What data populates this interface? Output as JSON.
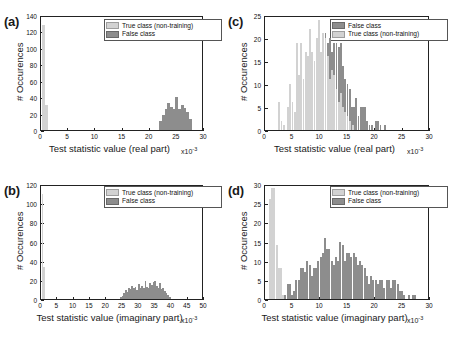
{
  "figure": {
    "series_labels": {
      "true_class": "True class (non-training)",
      "false_class": "False class"
    },
    "colors": {
      "true_class": "#d2d2d2",
      "false_class": "#8d8d8d",
      "axis": "#222222",
      "background": "#ffffff"
    },
    "ylabel": "# Occurences",
    "exponent": "x10",
    "exponent_sup": "-3"
  },
  "panels": [
    {
      "id": "a",
      "tag": "(a)"
    },
    {
      "id": "b",
      "tag": "(b)"
    },
    {
      "id": "c",
      "tag": "(c)"
    },
    {
      "id": "d",
      "tag": "(d)"
    }
  ],
  "chart_data": [
    {
      "panel": "a",
      "type": "bar",
      "title": "",
      "xlabel": "Test statistic value (real part)",
      "ylabel": "# Occurences",
      "xlim": [
        0,
        30
      ],
      "ylim": [
        0,
        140
      ],
      "xticks": [
        0,
        5,
        10,
        15,
        20,
        25,
        30
      ],
      "yticks": [
        0,
        20,
        40,
        60,
        80,
        100,
        120,
        140
      ],
      "xunit": "x10^-3",
      "grid": false,
      "legend_position": "top-right",
      "legend_order": [
        "True class (non-training)",
        "False class"
      ],
      "bin_width": 0.5,
      "series": [
        {
          "name": "True class (non-training)",
          "x": [
            0.5,
            1.0
          ],
          "values": [
            128,
            31
          ]
        },
        {
          "name": "False class",
          "x": [
            22.0,
            22.5,
            23.0,
            23.5,
            24.0,
            24.5,
            25.0,
            25.5,
            26.0,
            26.5,
            27.0,
            27.5
          ],
          "values": [
            11,
            18,
            26,
            33,
            28,
            25,
            40,
            25,
            31,
            27,
            22,
            13
          ]
        }
      ]
    },
    {
      "panel": "b",
      "type": "bar",
      "title": "",
      "xlabel": "Test statistic value (imaginary part)",
      "ylabel": "# Occurences",
      "xlim": [
        0,
        50
      ],
      "ylim": [
        0,
        120
      ],
      "xticks": [
        0,
        5,
        10,
        15,
        20,
        25,
        30,
        35,
        40,
        45,
        50
      ],
      "yticks": [
        0,
        20,
        40,
        60,
        80,
        100,
        120
      ],
      "xunit": "x10^-3",
      "grid": false,
      "legend_position": "top-right",
      "legend_order": [
        "True class (non-training)",
        "False class"
      ],
      "bin_width": 0.5,
      "series": [
        {
          "name": "True class (non-training)",
          "x": [
            0.5,
            1.0
          ],
          "values": [
            110,
            33
          ]
        },
        {
          "name": "False class",
          "x": [
            24.5,
            25.0,
            25.5,
            26.0,
            26.5,
            27.0,
            27.5,
            28.0,
            28.5,
            29.0,
            29.5,
            30.0,
            30.5,
            31.0,
            31.5,
            32.0,
            32.5,
            33.0,
            33.5,
            34.0,
            34.5,
            35.0,
            35.5,
            36.0,
            36.5,
            37.0,
            37.5,
            38.0,
            38.5,
            39.0,
            39.5
          ],
          "values": [
            2,
            3,
            6,
            9,
            7,
            12,
            10,
            14,
            11,
            13,
            9,
            16,
            11,
            14,
            12,
            19,
            13,
            11,
            17,
            15,
            18,
            19,
            14,
            12,
            17,
            10,
            12,
            8,
            6,
            4,
            2
          ]
        }
      ]
    },
    {
      "panel": "c",
      "type": "bar",
      "title": "",
      "xlabel": "Test statistic value (real part)",
      "ylabel": "# Occurences",
      "xlim": [
        0,
        30
      ],
      "ylim": [
        0,
        25
      ],
      "xticks": [
        0,
        5,
        10,
        15,
        20,
        25,
        30
      ],
      "yticks": [
        0,
        5,
        10,
        15,
        20,
        25
      ],
      "xunit": "x10^-3",
      "grid": false,
      "legend_position": "top-right",
      "legend_order": [
        "False class",
        "True class (non-training)"
      ],
      "bin_width": 0.35,
      "series": [
        {
          "name": "True class (non-training)",
          "x": [
            2.6,
            3.0,
            3.4,
            4.2,
            4.6,
            5.0,
            5.4,
            5.8,
            6.2,
            6.6,
            7.0,
            7.4,
            7.8,
            8.2,
            8.6,
            9.0,
            9.4,
            9.8,
            10.2,
            10.6,
            11.0,
            11.4,
            11.8,
            12.2,
            12.6,
            13.0,
            13.4,
            13.8,
            14.2,
            14.6,
            15.0,
            15.4,
            16.0
          ],
          "values": [
            6,
            2,
            1,
            5,
            10,
            6,
            4,
            19,
            12,
            19,
            11,
            17,
            16,
            22,
            17,
            15,
            20,
            24,
            17,
            21,
            20,
            16,
            11,
            13,
            12,
            9,
            6,
            8,
            5,
            4,
            3,
            2,
            1
          ]
        },
        {
          "name": "False class",
          "x": [
            2.6,
            3.4,
            4.2,
            4.6,
            5.0,
            5.8,
            6.2,
            6.6,
            7.0,
            7.4,
            7.8,
            8.2,
            8.6,
            9.0,
            9.4,
            9.8,
            10.2,
            10.6,
            11.0,
            11.4,
            11.8,
            12.2,
            12.6,
            13.0,
            13.4,
            13.8,
            14.2,
            14.6,
            15.0,
            15.4,
            15.8,
            16.2,
            16.6,
            17.0,
            17.4,
            17.8,
            18.2,
            18.6,
            19.0,
            19.4,
            20.2,
            20.6,
            21.0,
            21.8
          ],
          "values": [
            1,
            1,
            2,
            1,
            3,
            4,
            3,
            5,
            2,
            5,
            6,
            9,
            10,
            12,
            14,
            10,
            16,
            14,
            21,
            19,
            20,
            17,
            19,
            19,
            18,
            19,
            14,
            11,
            10,
            9,
            5,
            5,
            7,
            3,
            5,
            5,
            5,
            2,
            1,
            1,
            2,
            2,
            1,
            1
          ]
        }
      ]
    },
    {
      "panel": "d",
      "type": "bar",
      "title": "",
      "xlabel": "Test statistic value (imaginary part)",
      "ylabel": "# Occurences",
      "xlim": [
        0,
        30
      ],
      "ylim": [
        0,
        30
      ],
      "xticks": [
        0,
        5,
        10,
        15,
        20,
        25,
        30
      ],
      "yticks": [
        0,
        5,
        10,
        15,
        20,
        25,
        30
      ],
      "xunit": "x10^-3",
      "grid": false,
      "legend_position": "top-right",
      "legend_order": [
        "True class (non-training)",
        "False class"
      ],
      "bin_width": 0.35,
      "series": [
        {
          "name": "True class (non-training)",
          "x": [
            0.9,
            1.3,
            1.7,
            2.1,
            2.5,
            2.9,
            3.3
          ],
          "values": [
            26,
            29,
            29,
            14,
            8,
            8,
            1
          ]
        },
        {
          "name": "False class",
          "x": [
            3.7,
            4.1,
            4.5,
            4.9,
            5.3,
            5.7,
            6.1,
            6.5,
            6.9,
            7.3,
            7.7,
            8.1,
            8.5,
            8.9,
            9.3,
            9.7,
            10.1,
            10.5,
            10.9,
            11.3,
            11.7,
            12.1,
            12.5,
            12.9,
            13.3,
            13.7,
            14.1,
            14.5,
            14.9,
            15.3,
            15.7,
            16.1,
            16.5,
            16.9,
            17.3,
            17.7,
            18.1,
            18.5,
            18.9,
            19.3,
            19.7,
            20.1,
            20.5,
            20.9,
            21.3,
            21.7,
            22.1,
            22.5,
            22.9,
            23.3,
            23.7,
            24.1,
            24.5,
            24.9,
            25.3,
            26.1,
            26.9,
            27.3
          ],
          "values": [
            1,
            4,
            4,
            1,
            2,
            5,
            5,
            8,
            8,
            7,
            10,
            9,
            6,
            8,
            8,
            10,
            11,
            12,
            16,
            13,
            13,
            10,
            9,
            11,
            10,
            15,
            14,
            10,
            12,
            12,
            11,
            12,
            11,
            9,
            10,
            9,
            8,
            6,
            4,
            6,
            5,
            5,
            4,
            5,
            5,
            3,
            5,
            5,
            3,
            5,
            5,
            4,
            2,
            2,
            1,
            1,
            1,
            1
          ]
        }
      ]
    }
  ]
}
